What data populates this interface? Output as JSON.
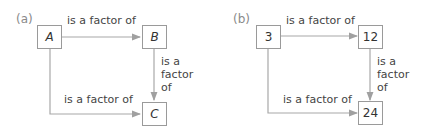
{
  "panels": [
    {
      "label": "(a)",
      "nodes": {
        "top_left": "A",
        "top_right": "B",
        "bottom_right": "C"
      },
      "edges": {
        "top": "is a factor of",
        "right": [
          "is a",
          "factor",
          "of"
        ],
        "bottom": "is a factor of"
      }
    },
    {
      "label": "(b)",
      "nodes": {
        "top_left": "3",
        "top_right": "12",
        "bottom_right": "24"
      },
      "edges": {
        "top": "is a factor of",
        "right": [
          "is a",
          "factor",
          "of"
        ],
        "bottom": "is a factor of"
      }
    }
  ],
  "colors": {
    "arrow": "#a0a0a0",
    "box_border": "#9a9a9a",
    "text": "#444444"
  }
}
